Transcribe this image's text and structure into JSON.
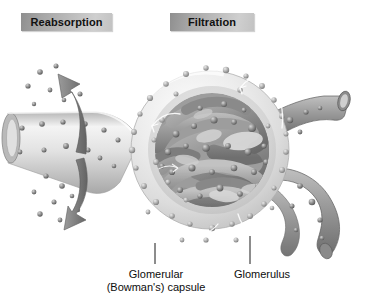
{
  "figure": {
    "background_color": "#ffffff"
  },
  "process_labels": [
    {
      "id": "reabsorption",
      "text": "Reabsorption",
      "box_fill_dark": "#8f8f8f",
      "box_fill_light": "#cfcfcf",
      "text_color": "#111111"
    },
    {
      "id": "filtration",
      "text": "Filtration",
      "box_fill_dark": "#8f8f8f",
      "box_fill_light": "#cfcfcf",
      "text_color": "#111111"
    }
  ],
  "structure_labels": [
    {
      "id": "glomerular-capsule",
      "line1": "Glomerular",
      "line2": "(Bowman's) capsule",
      "leader_x": 155,
      "leader_y_top": 243,
      "leader_y_bottom": 264
    },
    {
      "id": "glomerulus",
      "line1": "Glomerulus",
      "line2": "",
      "leader_x": 250,
      "leader_y_top": 236,
      "leader_y_bottom": 264
    }
  ],
  "anatomy": {
    "capsule": {
      "name": "Glomerular (Bowman's) capsule",
      "center_x": 210,
      "center_y": 150,
      "radius": 79,
      "fill_light": "#f2f2f2",
      "fill_mid": "#d8d8d8",
      "fill_shadow": "#b4b4b4"
    },
    "glomerulus": {
      "name": "Glomerulus capillary tuft",
      "center_x": 212,
      "center_y": 150,
      "radius": 56,
      "capillary_color_light": "#b9b9b9",
      "capillary_color_mid": "#949494",
      "capillary_color_dark": "#6e6e6e"
    },
    "tubule": {
      "name": "Proximal tubule",
      "color_light": "#ececec",
      "color_mid": "#c9c9c9",
      "color_dark": "#9a9a9a",
      "lumen_color": "#d5d5d5"
    },
    "arterioles": [
      {
        "name": "Efferent arteriole (upper)",
        "color_light": "#b5b5b5",
        "color_dark": "#7a7a7a"
      },
      {
        "name": "Afferent arteriole (lower)",
        "color_light": "#b5b5b5",
        "color_dark": "#7a7a7a"
      }
    ],
    "particles": {
      "name": "Solute particles",
      "fill_light": "#c4c4c4",
      "fill_dark": "#636363",
      "count_capsule_space": 72,
      "count_capillary": 58,
      "count_tubule_field": 26
    },
    "reabsorption_arrows": {
      "count": 2,
      "color": "#7b7b7b",
      "description": "Two large curved gray arrows leaving the tubule, one upward and one downward"
    },
    "flow_arrows": {
      "count": 6,
      "color": "#ffffff",
      "description": "Small white curved arrows showing filtrate movement inside the capsular space"
    }
  }
}
